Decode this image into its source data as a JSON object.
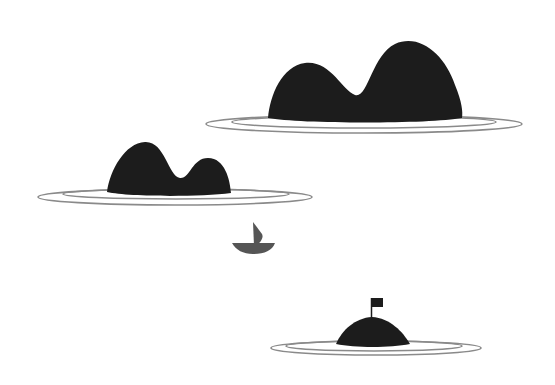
{
  "scene": {
    "description": "Minimalist illustration of three dark islands with ripple rings and a small sailboat",
    "colors": {
      "background": "#ffffff",
      "island": "#1c1c1c",
      "ring": "#8a8a8a",
      "boat": "#555555",
      "flag": "#1c1c1c"
    },
    "elements": [
      {
        "name": "large-island",
        "shape": "two-peaked"
      },
      {
        "name": "medium-island",
        "shape": "two-peaked"
      },
      {
        "name": "sailboat"
      },
      {
        "name": "small-island-with-flag",
        "shape": "dome"
      }
    ]
  }
}
